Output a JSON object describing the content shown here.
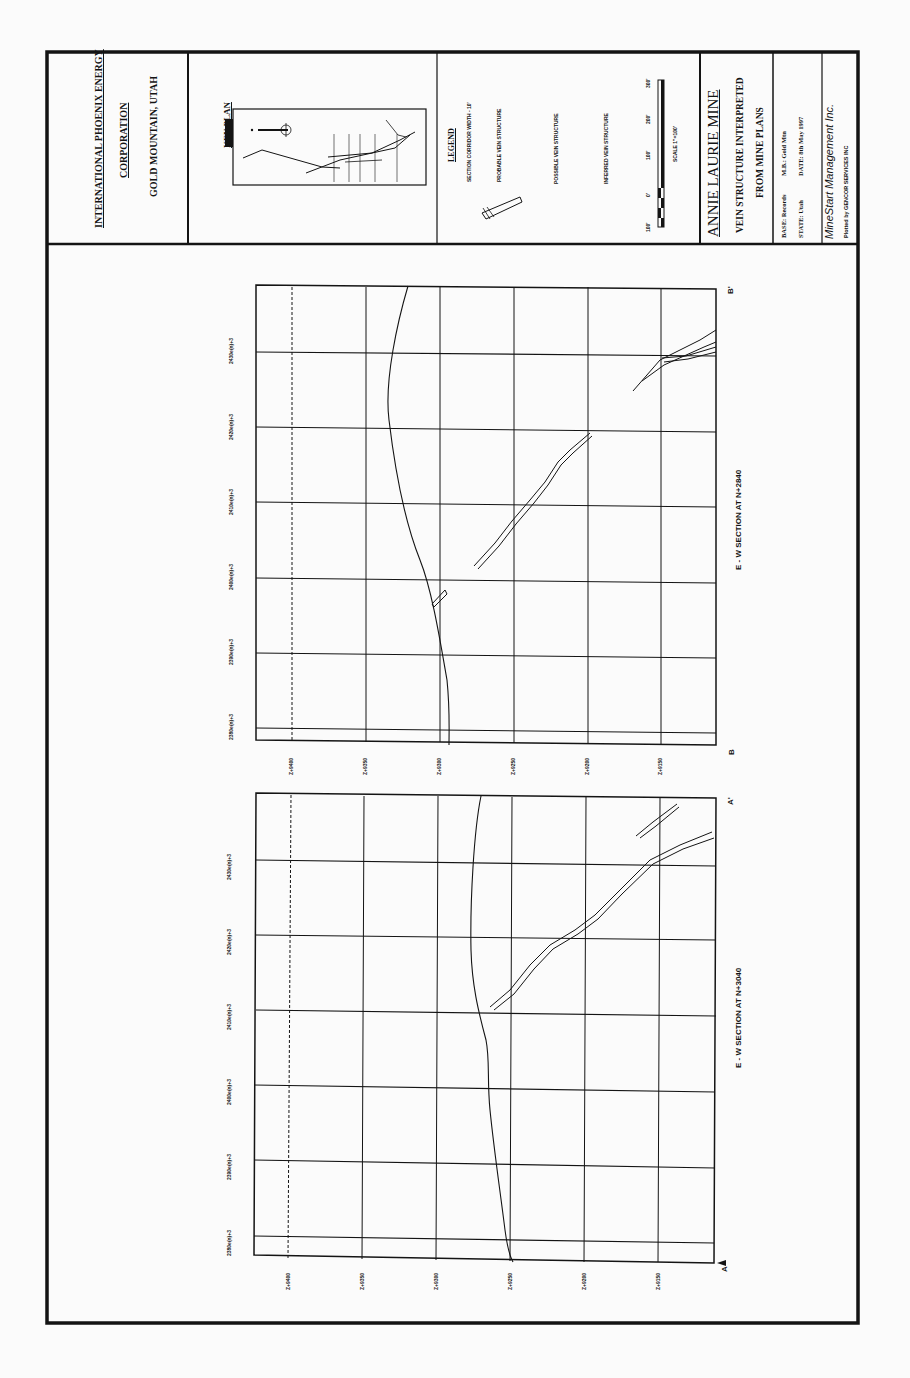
{
  "title_block": {
    "company_line1": "INTERNATIONAL PHOENIX ENERGY",
    "company_line2": "CORPORATION",
    "location": "GOLD MOUNTAIN, UTAH",
    "key_plan_title": "KEY PLAN",
    "legend_title": "LEGEND",
    "legend_items": [
      "SECTION CORRIDOR WIDTH - 10'",
      "PROBABLE VEIN STRUCTURE",
      "POSSIBLE VEIN STRUCTURE",
      "INFERRED VEIN STRUCTURE"
    ],
    "scale_labels": [
      "100'",
      "0'",
      "100'",
      "200'",
      "300'"
    ],
    "scale_caption": "SCALE 1\"=100'",
    "mine_name": "ANNIE LAURIE MINE",
    "subtitle_line1": "VEIN STRUCTURE INTERPRETED",
    "subtitle_line2": "FROM MINE PLANS",
    "base_label": "BASE: Records",
    "state_label": "STATE: Utah",
    "mb_label": "M.B.: Gold Mtn",
    "date_label": "DATE: 8th May 1997",
    "firm": "MineStart Management Inc.",
    "plotted_by": "Plotted by GENCOR SERVICES INC"
  },
  "sections": [
    {
      "id": "B-B'",
      "caption": "E - W SECTION AT N+2840",
      "start_marker": "B",
      "end_marker": "B'",
      "easting_ticks": [
        "2380e(n)+3",
        "2390e(n)+3",
        "2400e(n)+3",
        "2410e(n)+3",
        "2420e(n)+3",
        "2430e(n)+3"
      ],
      "elevation_ticks": [
        "Z+9400",
        "Z+9350",
        "Z+9300",
        "Z+9250",
        "Z+9200",
        "Z+9150"
      ]
    },
    {
      "id": "A-A'",
      "caption": "E - W SECTION AT N+3040",
      "start_marker": "A",
      "end_marker": "A'",
      "easting_ticks": [
        "2380e(n)+3",
        "2390e(n)+3",
        "2400e(n)+3",
        "2410e(n)+3",
        "2420e(n)+3",
        "2430e(n)+3"
      ],
      "elevation_ticks": [
        "Z+9400",
        "Z+9350",
        "Z+9300",
        "Z+9250",
        "Z+9200",
        "Z+9150"
      ]
    }
  ],
  "colors": {
    "ink": "#141414",
    "paper": "#fbfbfb"
  }
}
